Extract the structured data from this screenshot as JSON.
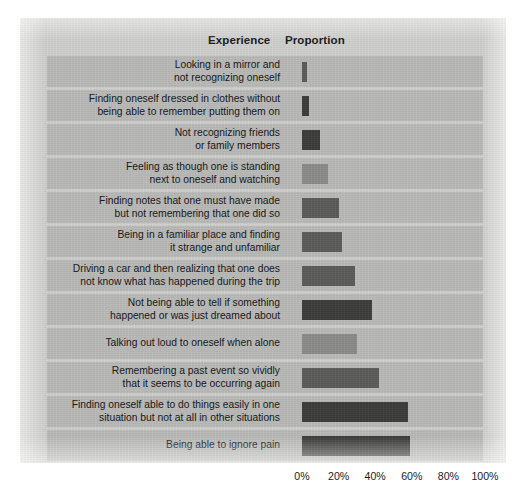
{
  "headers": {
    "experience": "Experience",
    "proportion": "Proportion"
  },
  "axis": {
    "ticks": [
      "0%",
      "20%",
      "40%",
      "60%",
      "80%",
      "100%"
    ],
    "tick_values": [
      0,
      20,
      40,
      60,
      80,
      100
    ],
    "min": 0,
    "max": 100
  },
  "colors": {
    "panel_background": "#cfcfcd",
    "row_band": "#b9b9b7",
    "bar_dark": "#3b3b39",
    "bar_medium": "#5a5a58",
    "bar_light": "#8a8a88",
    "text": "#131517"
  },
  "chart_data": {
    "type": "bar",
    "orientation": "horizontal",
    "title": "",
    "xlabel": "Proportion",
    "ylabel": "Experience",
    "xlim": [
      0,
      100
    ],
    "grid": false,
    "legend": "none",
    "tick_labels": [
      "0%",
      "20%",
      "40%",
      "60%",
      "80%",
      "100%"
    ],
    "categories": [
      "Looking in a mirror and\nnot recognizing oneself",
      "Finding oneself dressed in clothes without\nbeing able to remember putting them on",
      "Not recognizing friends\nor family members",
      "Feeling as though one is standing\nnext to oneself and watching",
      "Finding notes that one must have made\nbut not remembering that one did so",
      "Being in a familiar place and finding\nit strange and unfamiliar",
      "Driving a car and then realizing that one does\nnot know what has happened during the trip",
      "Not being able to tell if something\nhappened or was just dreamed about",
      "Talking out loud to oneself when alone",
      "Remembering a past event so vividly\nthat it seems to be occurring again",
      "Finding oneself able to do things easily in one\nsituation but not at all in other situations",
      "Being able to ignore pain"
    ],
    "values": [
      3,
      4,
      10,
      14,
      20,
      22,
      29,
      38,
      30,
      42,
      58,
      59
    ],
    "bar_shades": [
      "bar_medium",
      "bar_dark",
      "bar_dark",
      "bar_light",
      "bar_medium",
      "bar_medium",
      "bar_medium",
      "bar_dark",
      "bar_light",
      "bar_medium",
      "bar_dark",
      "bar_dark"
    ]
  }
}
